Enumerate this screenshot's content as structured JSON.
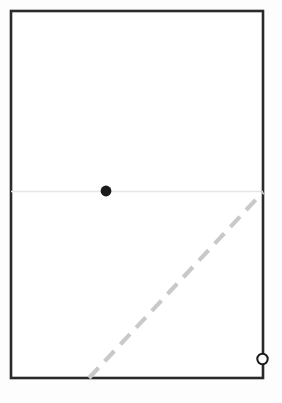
{
  "canvas": {
    "width": 282,
    "height": 403,
    "background_color": "#fdfdfd"
  },
  "diagram": {
    "title": "",
    "elements": [
      {
        "name": "outer-rectangle",
        "shape": "rectangle",
        "x": 11,
        "y": 11,
        "width": 252,
        "height": 367,
        "stroke_color": "#2a2a2a",
        "stroke_width": 2.6,
        "fill_color": "#ffffff"
      },
      {
        "name": "horizontal-divider-line",
        "shape": "line",
        "x1": 11,
        "y1": 191.5,
        "x2": 263,
        "y2": 191.5,
        "stroke_color": "#e6e6e6",
        "stroke_width": 1.6,
        "dash": "none"
      },
      {
        "name": "filled-dot-marker",
        "shape": "circle",
        "cx": 106,
        "cy": 191,
        "r": 5.4,
        "fill_color": "#1a1a1a",
        "stroke_color": "none",
        "stroke_width": 0
      },
      {
        "name": "dashed-diagonal-line",
        "shape": "line",
        "x1": 89,
        "y1": 378,
        "x2": 263,
        "y2": 192,
        "stroke_color": "#c9c9c9",
        "stroke_width": 4.2,
        "dash": "14 9"
      },
      {
        "name": "open-circle-marker",
        "shape": "circle",
        "cx": 262.5,
        "cy": 359,
        "r": 5.2,
        "fill_color": "#ffffff",
        "stroke_color": "#1a1a1a",
        "stroke_width": 2.0
      }
    ]
  },
  "labels": {
    "visible_text": []
  }
}
